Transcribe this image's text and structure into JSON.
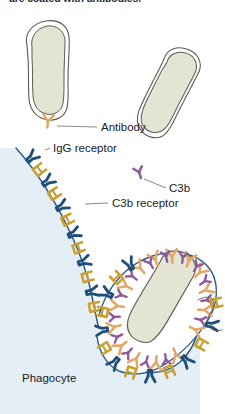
{
  "figure": {
    "title_clipped": "are coated with antibodies.",
    "background_color": "#ffffff"
  },
  "labels": {
    "antibody": "Antibody",
    "igg_receptor": "IgG receptor",
    "c3b": "C3b",
    "c3b_receptor": "C3b receptor",
    "phagocyte": "Phagocyte"
  },
  "colors": {
    "cytoplasm": "#e3eef7",
    "bacterium_fill": "#e4e4d5",
    "bacterium_outline": "#5a5a52",
    "membrane_line": "#2d5c8a",
    "igg_receptor": "#1f4e79",
    "c3b_receptor": "#c8a034",
    "antibody": "#e3a868",
    "c3b": "#8f5a9e",
    "leader_line": "#6b6b6b",
    "text": "#1b1b1b"
  },
  "elements": {
    "free_bacteria_count": 2,
    "engulfed_bacteria_count": 1,
    "membrane_igg_receptor_count": 12,
    "membrane_c3b_receptor_count": 11
  }
}
